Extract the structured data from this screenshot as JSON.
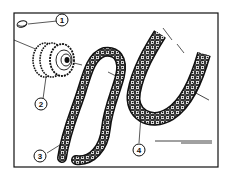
{
  "diagram": {
    "type": "exploded-parts-illustration",
    "frame": {
      "x": 14,
      "y": 13,
      "width": 204,
      "height": 154
    },
    "callouts": [
      {
        "id": 1,
        "label": "1",
        "cx": 62,
        "cy": 20
      },
      {
        "id": 2,
        "label": "2",
        "cx": 41,
        "cy": 105
      },
      {
        "id": 3,
        "label": "3",
        "cx": 41,
        "cy": 156
      },
      {
        "id": 4,
        "label": "4",
        "cx": 140,
        "cy": 150
      }
    ],
    "parts": [
      {
        "callout": "1",
        "name": "key"
      },
      {
        "callout": "2",
        "name": "sprocket"
      },
      {
        "callout": "3",
        "name": "chain"
      },
      {
        "callout": "4",
        "name": "chain"
      }
    ],
    "colors": {
      "ink": "#111111",
      "paper": "#ffffff"
    }
  }
}
